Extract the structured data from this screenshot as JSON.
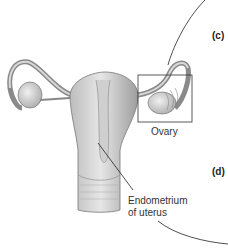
{
  "labels": {
    "ovary": "Ovary",
    "endometrium_line1": "Endometrium",
    "endometrium_line2": "of uterus"
  },
  "panels": {
    "c": "(c)",
    "d": "(d)"
  }
}
